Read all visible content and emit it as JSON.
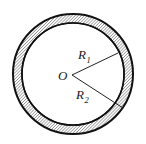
{
  "figure": {
    "background_color": "#ffffff",
    "stroke_color": "#111111",
    "hatch_color": "#4d4d4d",
    "labels": {
      "center": "O",
      "inner_radius_main": "R",
      "inner_radius_sub": "1",
      "outer_radius_main": "R",
      "outer_radius_sub": "2"
    },
    "geometry": {
      "center_x": 73,
      "center_y": 74,
      "outer_radius": 60,
      "inner_radius": 51,
      "outer_stroke_width": 2,
      "inner_stroke_width": 1.6,
      "hatch_angle_degrees": 45,
      "hatch_spacing": 2.2
    },
    "radius_lines": [
      {
        "name": "R1",
        "from_x": 72,
        "from_y": 75,
        "to_x": 118,
        "to_y": 53,
        "label_x": 78,
        "label_y": 59
      },
      {
        "name": "R2",
        "from_x": 72,
        "from_y": 75,
        "to_x": 123,
        "to_y": 108,
        "label_x": 76,
        "label_y": 99
      }
    ]
  }
}
